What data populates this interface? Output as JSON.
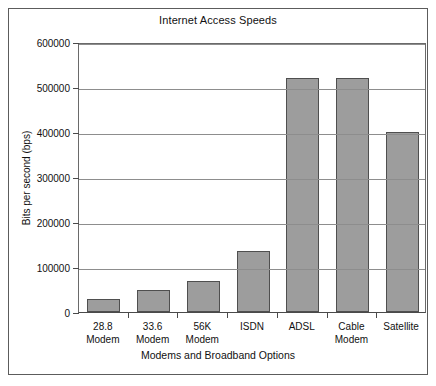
{
  "chart_data": {
    "type": "bar",
    "title": "Internet Access Speeds",
    "xlabel": "Modems and Broadband Options",
    "ylabel": "Bits per second (bps)",
    "categories": [
      "28.8 Modem",
      "33.6 Modem",
      "56K Modem",
      "ISDN",
      "ADSL",
      "Cable Modem",
      "Satellite"
    ],
    "category_lines": [
      [
        "28.8",
        "Modem"
      ],
      [
        "33.6",
        "Modem"
      ],
      [
        "56K",
        "Modem"
      ],
      [
        "ISDN"
      ],
      [
        "ADSL"
      ],
      [
        "Cable",
        "Modem"
      ],
      [
        "Satellite"
      ]
    ],
    "values": [
      30000,
      50000,
      70000,
      135000,
      520000,
      520000,
      400000
    ],
    "ylim": [
      0,
      600000
    ],
    "ytick_values": [
      0,
      100000,
      200000,
      300000,
      400000,
      500000,
      600000
    ],
    "ytick_labels": [
      "0",
      "100000",
      "200000",
      "300000",
      "400000",
      "500000",
      "600000"
    ],
    "grid": true,
    "legend": false,
    "bar_color": "#9d9d9d",
    "bar_border_color": "#4f4f4f",
    "grid_color": "#8d8d8d",
    "axis_color": "#4a4a4a",
    "text_color": "#111111"
  }
}
